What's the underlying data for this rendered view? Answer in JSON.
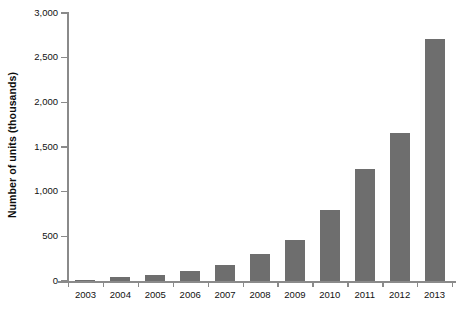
{
  "chart_data": {
    "type": "bar",
    "title": "",
    "subtitle": "",
    "xlabel": "",
    "ylabel": "Number of units (thousands)",
    "categories": [
      "2003",
      "2004",
      "2005",
      "2006",
      "2007",
      "2008",
      "2009",
      "2010",
      "2011",
      "2012",
      "2013"
    ],
    "values": [
      10,
      40,
      70,
      110,
      180,
      300,
      460,
      790,
      1250,
      1660,
      2710
    ],
    "series": [
      {
        "name": "Number of units (thousands)",
        "values": [
          10,
          40,
          70,
          110,
          180,
          300,
          460,
          790,
          1250,
          1660,
          2710
        ]
      }
    ],
    "ylim": [
      0,
      3000
    ],
    "ytick_values": [
      0,
      500,
      1000,
      1500,
      2000,
      2500,
      3000
    ],
    "ytick_labels": [
      "0",
      "500",
      "1,000",
      "1,500",
      "2,000",
      "2,500",
      "3,000"
    ],
    "xtick_labels": [
      "2003",
      "2004",
      "2005",
      "2006",
      "2007",
      "2008",
      "2009",
      "2010",
      "2011",
      "2012",
      "2013"
    ],
    "grid": false,
    "legend": false,
    "legend_position": "none",
    "bar_color": "#6e6e6e",
    "axis_color": "#8a8a8a",
    "background_color": "#ffffff",
    "text_color": "#111111"
  }
}
